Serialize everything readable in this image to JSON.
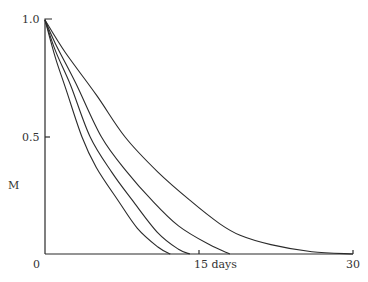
{
  "chart_data": {
    "type": "line",
    "title": "",
    "xlabel": "days",
    "ylabel": "M",
    "xlim": [
      0,
      30
    ],
    "ylim": [
      0,
      1.0
    ],
    "grid": false,
    "legend": null,
    "x_ticks": [
      {
        "value": 0,
        "label": "0"
      },
      {
        "value": 15,
        "label": "15 days"
      },
      {
        "value": 30,
        "label": "30"
      }
    ],
    "y_ticks": [
      {
        "value": 0.5,
        "label": "0.5"
      },
      {
        "value": 1.0,
        "label": "1.0"
      }
    ],
    "series": [
      {
        "name": "curve-1",
        "x": [
          0,
          1,
          2,
          3.6,
          5,
          7.1,
          9,
          11,
          12.2
        ],
        "y": [
          1.0,
          0.84,
          0.71,
          0.5,
          0.37,
          0.23,
          0.11,
          0.03,
          0.0
        ]
      },
      {
        "name": "curve-2",
        "x": [
          0,
          1,
          2.5,
          4.4,
          6.5,
          8.5,
          11,
          13,
          14.1
        ],
        "y": [
          1.0,
          0.87,
          0.72,
          0.5,
          0.35,
          0.23,
          0.09,
          0.02,
          0.0
        ]
      },
      {
        "name": "curve-3",
        "x": [
          0,
          1,
          3,
          5.5,
          8,
          10.4,
          13,
          16,
          18
        ],
        "y": [
          1.0,
          0.9,
          0.73,
          0.5,
          0.35,
          0.23,
          0.12,
          0.04,
          0.0
        ]
      },
      {
        "name": "curve-4",
        "x": [
          0,
          2,
          5,
          7.8,
          11,
          14.1,
          17,
          19,
          22,
          26,
          30
        ],
        "y": [
          1.0,
          0.86,
          0.68,
          0.5,
          0.35,
          0.23,
          0.13,
          0.08,
          0.04,
          0.01,
          0.0
        ]
      }
    ]
  },
  "labels": {
    "y_axis": "M",
    "origin": "0",
    "y_half": "0.5",
    "y_one": "1.0",
    "x_mid": "15 days",
    "x_end": "30"
  }
}
